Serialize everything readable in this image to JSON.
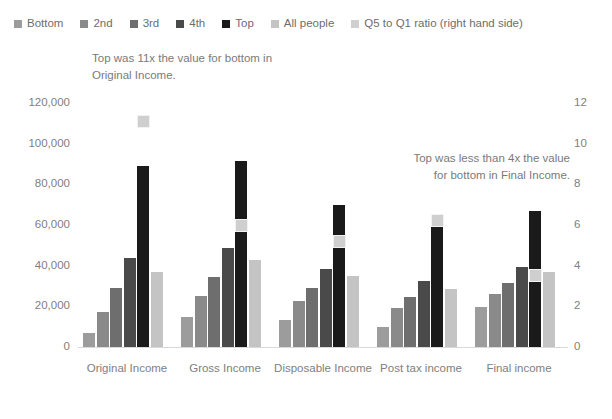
{
  "legend": {
    "items": [
      {
        "label": "Bottom",
        "color": "#9c9c9c"
      },
      {
        "label": "2nd",
        "color": "#8a8a8a"
      },
      {
        "label": "3rd",
        "color": "#6e6e6e"
      },
      {
        "label": "4th",
        "color": "#4a4a4a"
      },
      {
        "label": "Top",
        "color": "#1a1a1a"
      },
      {
        "label": "All people",
        "color": "#c4c4c4"
      },
      {
        "label": "Q5 to Q1 ratio (right hand side)",
        "color": "#cfcfcf"
      }
    ]
  },
  "annotations": {
    "left": "Top was 11x the value for bottom in Original Income.",
    "right": "Top was less than 4x the value for bottom in Final Income."
  },
  "axes": {
    "left_ticks": [
      "120,000",
      "100,000",
      "80,000",
      "60,000",
      "40,000",
      "20,000",
      "0"
    ],
    "right_ticks": [
      "12",
      "10",
      "8",
      "6",
      "4",
      "2",
      "0"
    ]
  },
  "chart_data": {
    "type": "bar",
    "title": "",
    "xlabel": "",
    "ylabel": "",
    "ylim": [
      0,
      120000
    ],
    "y2lim": [
      0,
      12
    ],
    "grid": false,
    "legend_position": "top",
    "categories": [
      "Original Income",
      "Gross Income",
      "Disposable Income",
      "Post tax income",
      "Final income"
    ],
    "series": [
      {
        "name": "Bottom",
        "color": "#9c9c9c",
        "axis": "left",
        "values": [
          7000,
          15000,
          13500,
          10000,
          19500
        ]
      },
      {
        "name": "2nd",
        "color": "#8a8a8a",
        "axis": "left",
        "values": [
          17000,
          25000,
          22500,
          19000,
          26000
        ]
      },
      {
        "name": "3rd",
        "color": "#6e6e6e",
        "axis": "left",
        "values": [
          29000,
          34500,
          29000,
          24500,
          31500
        ]
      },
      {
        "name": "4th",
        "color": "#4a4a4a",
        "axis": "left",
        "values": [
          44000,
          48500,
          38500,
          32500,
          39500
        ]
      },
      {
        "name": "Top",
        "color": "#1a1a1a",
        "axis": "left",
        "values": [
          89000,
          91500,
          70000,
          60500,
          67000
        ]
      },
      {
        "name": "All people",
        "color": "#c4c4c4",
        "axis": "left",
        "values": [
          37000,
          43000,
          35000,
          28500,
          37000
        ]
      },
      {
        "name": "Q5 to Q1 ratio (right hand side)",
        "color": "#cfcfcf",
        "axis": "right",
        "type": "marker",
        "values": [
          11.1,
          6.0,
          5.2,
          6.2,
          3.5
        ]
      }
    ]
  }
}
